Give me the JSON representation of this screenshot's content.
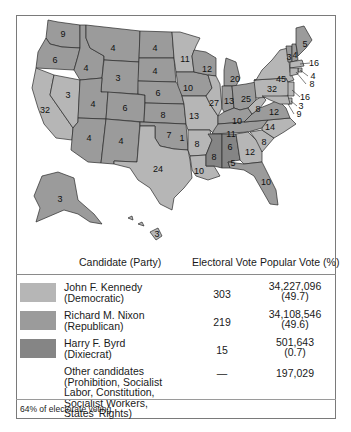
{
  "map": {
    "colors": {
      "kennedy": "#b6b6b6",
      "nixon": "#9b9b9b",
      "byrd": "#858585",
      "border": "#2a2a2a"
    },
    "state_labels": [
      {
        "id": "WA",
        "value": "9"
      },
      {
        "id": "OR",
        "value": "6"
      },
      {
        "id": "CA",
        "value": "32"
      },
      {
        "id": "NV",
        "value": "3"
      },
      {
        "id": "ID",
        "value": "4"
      },
      {
        "id": "MT",
        "value": "4"
      },
      {
        "id": "WY",
        "value": "3"
      },
      {
        "id": "UT",
        "value": "4"
      },
      {
        "id": "CO",
        "value": "6"
      },
      {
        "id": "AZ",
        "value": "4"
      },
      {
        "id": "NM",
        "value": "4"
      },
      {
        "id": "ND",
        "value": "4"
      },
      {
        "id": "SD",
        "value": "4"
      },
      {
        "id": "NE",
        "value": "6"
      },
      {
        "id": "KS",
        "value": "8"
      },
      {
        "id": "OK",
        "value": "7"
      },
      {
        "id": "OK-byrd",
        "value": "1"
      },
      {
        "id": "TX",
        "value": "24"
      },
      {
        "id": "MN",
        "value": "11"
      },
      {
        "id": "IA",
        "value": "10"
      },
      {
        "id": "MO",
        "value": "13"
      },
      {
        "id": "AR",
        "value": "8"
      },
      {
        "id": "LA",
        "value": "10"
      },
      {
        "id": "WI",
        "value": "12"
      },
      {
        "id": "IL",
        "value": "27"
      },
      {
        "id": "MI",
        "value": "20"
      },
      {
        "id": "IN",
        "value": "13"
      },
      {
        "id": "OH",
        "value": "25"
      },
      {
        "id": "KY",
        "value": "10"
      },
      {
        "id": "TN",
        "value": "11"
      },
      {
        "id": "MS",
        "value": "8"
      },
      {
        "id": "AL",
        "value": "6"
      },
      {
        "id": "AL-kennedy",
        "value": "5"
      },
      {
        "id": "GA",
        "value": "12"
      },
      {
        "id": "FL",
        "value": "10"
      },
      {
        "id": "SC",
        "value": "8"
      },
      {
        "id": "NC",
        "value": "14"
      },
      {
        "id": "VA",
        "value": "12"
      },
      {
        "id": "WV",
        "value": "8"
      },
      {
        "id": "PA",
        "value": "32"
      },
      {
        "id": "NY",
        "value": "45"
      },
      {
        "id": "VT",
        "value": "3"
      },
      {
        "id": "NH",
        "value": "4"
      },
      {
        "id": "ME",
        "value": "5"
      },
      {
        "id": "MA",
        "value": "16"
      },
      {
        "id": "RI",
        "value": "4"
      },
      {
        "id": "CT",
        "value": "8"
      },
      {
        "id": "NJ",
        "value": "16"
      },
      {
        "id": "DE",
        "value": "3"
      },
      {
        "id": "MD",
        "value": "9"
      },
      {
        "id": "AK",
        "value": "3"
      },
      {
        "id": "HI",
        "value": "3"
      }
    ]
  },
  "table": {
    "headers": {
      "candidate": "Candidate (Party)",
      "electoral": "Electoral Vote",
      "popular": "Popular Vote (%)"
    },
    "rows": [
      {
        "name": "John F. Kennedy",
        "party": "(Democratic)",
        "electoral": "303",
        "popular": "34,227,096",
        "percent": "(49.7)",
        "color": "#b6b6b6"
      },
      {
        "name": "Richard M. Nixon",
        "party": "(Republican)",
        "electoral": "219",
        "popular": "34,108,546",
        "percent": "(49.6)",
        "color": "#9b9b9b"
      },
      {
        "name": "Harry F. Byrd",
        "party": "(Dixiecrat)",
        "electoral": "15",
        "popular": "501,643",
        "percent": "(0.7)",
        "color": "#858585"
      },
      {
        "name": "Other candidates",
        "lines": [
          "(Prohibition, Socialist",
          "Labor, Constitution,",
          "Socialist Workers,",
          "States’ Rights)"
        ],
        "electoral": "—",
        "popular": "197,029"
      }
    ],
    "footer": "64% of electorate voting"
  }
}
